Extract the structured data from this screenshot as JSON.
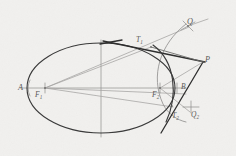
{
  "figure": {
    "background_color": "#f1f0ee",
    "curve_color": "#3a3a3a",
    "construction_color": "#a3a2a0",
    "width": 236,
    "height": 156
  },
  "labels": [
    {
      "id": "A",
      "text": "A",
      "sub": "",
      "x": 18,
      "y": 84,
      "size": "big"
    },
    {
      "id": "F1",
      "text": "F",
      "sub": "1",
      "x": 35,
      "y": 91,
      "size": "normal"
    },
    {
      "id": "F2",
      "text": "F",
      "sub": "2",
      "x": 152,
      "y": 91,
      "size": "normal"
    },
    {
      "id": "T1",
      "text": "T",
      "sub": "1",
      "x": 136,
      "y": 36,
      "size": "normal"
    },
    {
      "id": "T2",
      "text": "T",
      "sub": "2",
      "x": 172,
      "y": 112,
      "size": "normal"
    },
    {
      "id": "P",
      "text": "P",
      "sub": "",
      "x": 205,
      "y": 56,
      "size": "big"
    },
    {
      "id": "Q",
      "text": "Q",
      "sub": "",
      "x": 187,
      "y": 18,
      "size": "big"
    },
    {
      "id": "B",
      "text": "B",
      "sub": "",
      "x": 181,
      "y": 83,
      "size": "normal"
    },
    {
      "id": "Q2",
      "text": "Q",
      "sub": "2",
      "x": 191,
      "y": 111,
      "size": "normal"
    }
  ],
  "geometry": {
    "ellipse": {
      "cx": 101,
      "cy": 88,
      "rx": 74,
      "ry": 45
    },
    "major_axis": {
      "x1": 22,
      "y1": 88,
      "x2": 182,
      "y2": 88
    },
    "minor_axis": {
      "x1": 101,
      "y1": 40,
      "x2": 101,
      "y2": 136
    },
    "focus_1": {
      "x": 45,
      "y": 88
    },
    "focus_2": {
      "x": 160,
      "y": 88
    },
    "vertex_A": {
      "x": 27,
      "y": 88
    },
    "point_P": {
      "x": 203,
      "y": 62
    },
    "point_Q": {
      "x": 188,
      "y": 26
    },
    "point_T1": {
      "x": 151,
      "y": 47
    },
    "point_T2": {
      "x": 172,
      "y": 106
    },
    "point_B": {
      "x": 177,
      "y": 88
    }
  },
  "annotation": {
    "caption": "",
    "notes": ""
  }
}
